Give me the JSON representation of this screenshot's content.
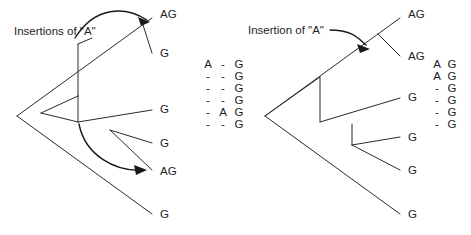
{
  "figure": {
    "background_color": "#ffffff",
    "line_color": "#2b2b2b",
    "text_color": "#1e1e1e",
    "width": 471,
    "height": 235
  },
  "left_panel": {
    "caption": "Insertions of \"A\"",
    "tip_labels": [
      "AG",
      "G",
      "G",
      "G",
      "AG",
      "G"
    ],
    "tip_positions": [
      {
        "x": 160,
        "y": 18
      },
      {
        "x": 160,
        "y": 55
      },
      {
        "x": 160,
        "y": 112
      },
      {
        "x": 160,
        "y": 145
      },
      {
        "x": 160,
        "y": 172
      },
      {
        "x": 160,
        "y": 216
      }
    ],
    "arrow_count": 2,
    "arrow_targets": [
      "AG-top-tip",
      "AG-lower-tip"
    ]
  },
  "right_panel": {
    "caption": "Insertion of \"A\"",
    "tip_labels": [
      "AG",
      "AG",
      "G",
      "G",
      "G",
      "G"
    ],
    "tip_positions": [
      {
        "x": 408,
        "y": 18
      },
      {
        "x": 408,
        "y": 58
      },
      {
        "x": 408,
        "y": 100
      },
      {
        "x": 408,
        "y": 140
      },
      {
        "x": 408,
        "y": 172
      },
      {
        "x": 408,
        "y": 216
      }
    ],
    "arrow_count": 1,
    "arrow_targets": [
      "internal-node"
    ]
  },
  "left_alignment": {
    "columns": 3,
    "rows": [
      [
        "A",
        "-",
        "G"
      ],
      [
        "-",
        "-",
        "G"
      ],
      [
        "-",
        "-",
        "G"
      ],
      [
        "-",
        "-",
        "G"
      ],
      [
        "-",
        "A",
        "G"
      ],
      [
        "-",
        "-",
        "G"
      ]
    ]
  },
  "right_alignment": {
    "columns": 2,
    "rows": [
      [
        "A",
        "G"
      ],
      [
        "A",
        "G"
      ],
      [
        "-",
        "G"
      ],
      [
        "-",
        "G"
      ],
      [
        "-",
        "G"
      ],
      [
        "-",
        "G"
      ]
    ]
  }
}
